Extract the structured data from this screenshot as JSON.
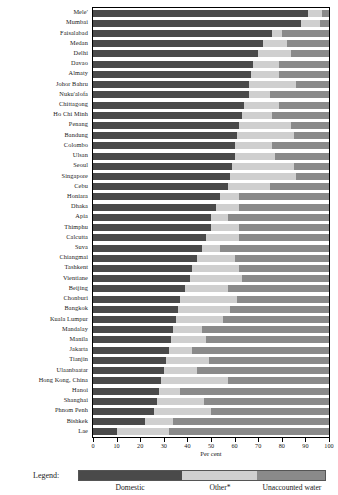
{
  "chart_data": {
    "type": "bar",
    "orientation": "horizontal",
    "stacked": true,
    "title": "",
    "xlabel": "Per cent",
    "ylabel": "",
    "xlim": [
      0,
      100
    ],
    "xticks": [
      0,
      10,
      20,
      30,
      40,
      50,
      60,
      70,
      80,
      90,
      100
    ],
    "grid": false,
    "legend_position": "bottom",
    "legend_title": "Legend:",
    "series": [
      {
        "name": "Domestic",
        "color": "#4a4a4a"
      },
      {
        "name": "Other*",
        "color": "#cfcfcf"
      },
      {
        "name": "Unaccounted water",
        "color": "#8a8a8a"
      }
    ],
    "categories": [
      "Mele'",
      "Mumbai",
      "Faisalabad",
      "Medan",
      "Delhi",
      "Davao",
      "Almaty",
      "Johor Bahru",
      "Nuku'alofa",
      "Chittagong",
      "Ho Chi Minh",
      "Penang",
      "Bandung",
      "Colombo",
      "Ulsan",
      "Seoul",
      "Singapore",
      "Cebu",
      "Honiara",
      "Dhaka",
      "Apia",
      "Thimphu",
      "Calcutta",
      "Suva",
      "Chiangmai",
      "Tashkent",
      "Vientiane",
      "Beijing",
      "Chonburi",
      "Bangkok",
      "Kuala Lumpur",
      "Mandalay",
      "Manila",
      "Jakarta",
      "Tianjin",
      "Ulaanbaatar",
      "Hong Kong, China",
      "Hanoi",
      "Shanghai",
      "Phnom Penh",
      "Bishkek",
      "Lae"
    ],
    "values": {
      "Domestic": [
        91,
        88,
        76,
        72,
        70,
        68,
        67,
        66,
        66,
        64,
        63,
        62,
        61,
        60,
        60,
        59,
        58,
        57,
        54,
        52,
        50,
        50,
        48,
        46,
        44,
        42,
        41,
        39,
        37,
        36,
        35,
        34,
        33,
        32,
        31,
        30,
        29,
        28,
        27,
        26,
        22,
        10
      ],
      "Other*": [
        6,
        8,
        4,
        10,
        14,
        11,
        12,
        20,
        9,
        15,
        13,
        22,
        24,
        16,
        17,
        26,
        28,
        18,
        8,
        10,
        7,
        12,
        14,
        8,
        16,
        20,
        22,
        18,
        24,
        22,
        20,
        12,
        15,
        10,
        18,
        14,
        28,
        9,
        20,
        24,
        12,
        22
      ],
      "Unaccounted water": [
        3,
        4,
        20,
        18,
        16,
        21,
        21,
        14,
        25,
        21,
        24,
        16,
        15,
        24,
        23,
        15,
        14,
        25,
        38,
        38,
        43,
        38,
        38,
        46,
        40,
        38,
        37,
        43,
        39,
        42,
        45,
        54,
        52,
        58,
        51,
        56,
        43,
        63,
        53,
        50,
        66,
        68
      ]
    }
  },
  "axis": {
    "tick_labels": [
      "0",
      "10",
      "20",
      "30",
      "40",
      "50",
      "60",
      "70",
      "80",
      "90",
      "100"
    ],
    "x_title": "Per cent"
  },
  "legend": {
    "label": "Legend:",
    "items": [
      {
        "name": "Domestic",
        "color": "#4a4a4a"
      },
      {
        "name": "Other*",
        "color": "#cfcfcf"
      },
      {
        "name": "Unaccounted water",
        "color": "#8a8a8a"
      }
    ]
  }
}
